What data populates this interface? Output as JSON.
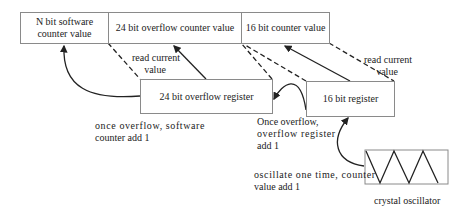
{
  "diagram": {
    "top_row": [
      {
        "id": "sw",
        "label": "N bit software counter value"
      },
      {
        "id": "ovf",
        "label": "24 bit overflow counter value"
      },
      {
        "id": "cnt",
        "label": "16 bit counter value"
      }
    ],
    "registers": {
      "overflow_register": "24 bit overflow register",
      "counter_register": "16 bit register",
      "oscillator_caption": "crystal oscillator"
    },
    "annotations": {
      "read_current_left_1": "read current",
      "read_current_left_2": "value",
      "read_current_right_1": "read current",
      "read_current_right_2": "value",
      "sw_add_1": "once overflow, software",
      "sw_add_2": "counter add 1",
      "ovf_add_1": "Once overflow,",
      "ovf_add_2": "overflow register",
      "ovf_add_3": "add 1",
      "osc_add_1": "oscillate one time, counter",
      "osc_add_2": "value add 1"
    },
    "colors": {
      "line": "#222222",
      "box_border": "#8a8a8a"
    }
  }
}
